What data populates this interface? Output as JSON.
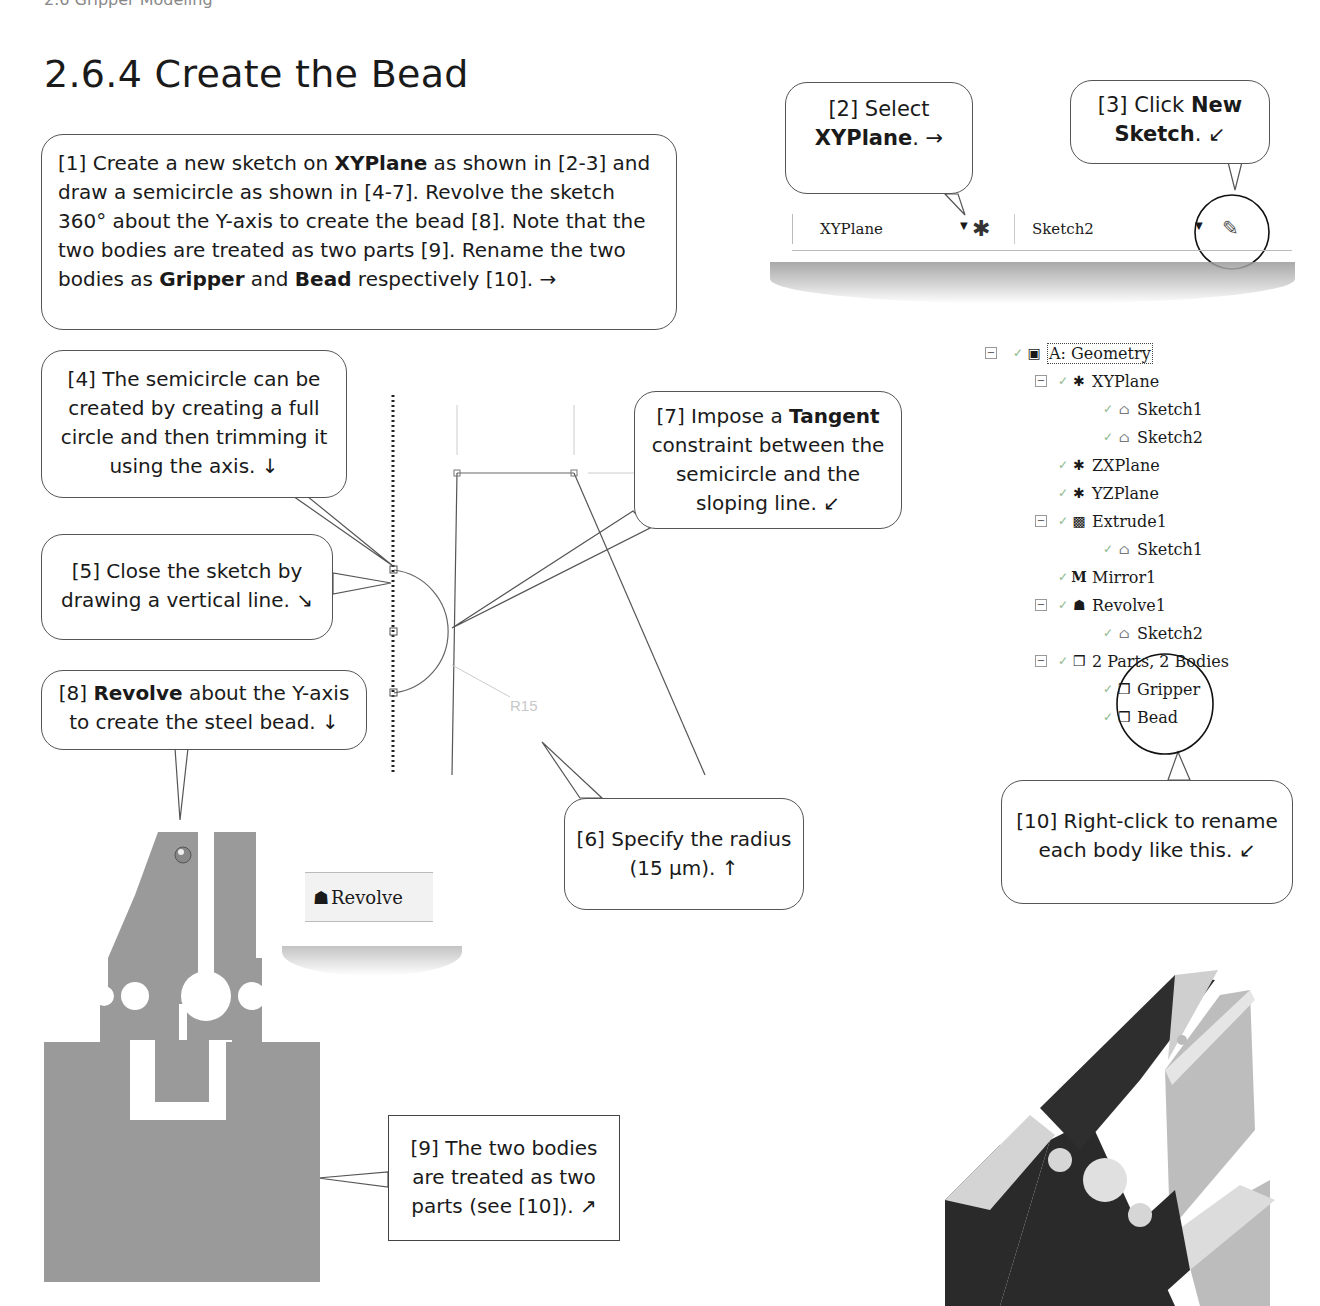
{
  "page": {
    "running_head": "2.6 Gripper Modeling",
    "section_title": "2.6.4  Create the Bead"
  },
  "callouts": {
    "c1": {
      "parts": [
        {
          "t": "[1] Create a new sketch on "
        },
        {
          "b": "XYPlane"
        },
        {
          "t": " as shown in [2-3] and draw a semicircle as shown in [4-7].  Revolve the sketch 360° about the Y-axis to create the bead [8].  Note that the two bodies are treated as two parts [9].  Rename the two bodies as "
        },
        {
          "b": "Gripper"
        },
        {
          "t": " and "
        },
        {
          "b": "Bead"
        },
        {
          "t": " respectively [10]. →"
        }
      ]
    },
    "c2": {
      "line1": "[2] Select",
      "bold": "XYPlane",
      "line2_suffix": ". →"
    },
    "c3": {
      "prefix": "[3] Click ",
      "bold1": "New",
      "bold2": "Sketch",
      "suffix": ". ↙"
    },
    "c4": {
      "text": "[4] The semicircle can be created by creating a full circle and then trimming it using the axis. ↓"
    },
    "c5": {
      "text": "[5] Close the sketch by drawing a vertical line. ↘"
    },
    "c6": {
      "line1": "[6] Specify the radius",
      "line2": "(15 μm). ↑"
    },
    "c7": {
      "prefix": "[7] Impose a ",
      "bold": "Tangent",
      "line2": "constraint between the",
      "line3": "semicircle and the",
      "line4": "sloping line. ↙"
    },
    "c8": {
      "prefix": "[8] ",
      "bold": "Revolve",
      "suffix": " about the Y-axis",
      "line2": "to create the steel bead. ↓"
    },
    "c9": {
      "line1": "[9] The two bodies",
      "line2": "are treated as two",
      "line3": "parts (see [10]). ↗"
    },
    "c10": {
      "line1": "[10] Right-click to rename",
      "line2": "each body like this. ↙"
    }
  },
  "toolbar": {
    "plane_combo": "XYPlane",
    "sketch_combo": "Sketch2",
    "plane_icon": "new-plane-icon",
    "new_sketch_icon": "new-sketch-icon"
  },
  "revolve_button": {
    "label": "Revolve",
    "icon": "revolve-icon"
  },
  "sketch": {
    "dimension_label": "R15"
  },
  "tree": {
    "items": [
      {
        "label": "A: Geometry",
        "icon": "geometry-icon",
        "level": 0,
        "expander": true
      },
      {
        "label": "XYPlane",
        "icon": "plane-icon",
        "level": 1,
        "expander": true
      },
      {
        "label": "Sketch1",
        "icon": "sketch-icon",
        "level": 2,
        "expander": false
      },
      {
        "label": "Sketch2",
        "icon": "sketch-icon",
        "level": 2,
        "expander": false
      },
      {
        "label": "ZXPlane",
        "icon": "plane-icon",
        "level": 1,
        "expander": false
      },
      {
        "label": "YZPlane",
        "icon": "plane-icon",
        "level": 1,
        "expander": false
      },
      {
        "label": "Extrude1",
        "icon": "extrude-icon",
        "level": 1,
        "expander": true
      },
      {
        "label": "Sketch1",
        "icon": "sketch-icon",
        "level": 2,
        "expander": false
      },
      {
        "label": "Mirror1",
        "icon": "mirror-icon",
        "level": 1,
        "expander": false
      },
      {
        "label": "Revolve1",
        "icon": "revolve-icon",
        "level": 1,
        "expander": true
      },
      {
        "label": "Sketch2",
        "icon": "sketch-icon",
        "level": 2,
        "expander": false
      },
      {
        "label": "2 Parts, 2 Bodies",
        "icon": "parts-icon",
        "level": 1,
        "expander": true
      },
      {
        "label": "Gripper",
        "icon": "body-icon",
        "level": 2,
        "expander": false
      },
      {
        "label": "Bead",
        "icon": "body-icon",
        "level": 2,
        "expander": false
      }
    ]
  },
  "colors": {
    "gripper_fill": "#9a9a9a",
    "model_dark": "#2b2b2b",
    "model_light": "#d9d9d9"
  }
}
